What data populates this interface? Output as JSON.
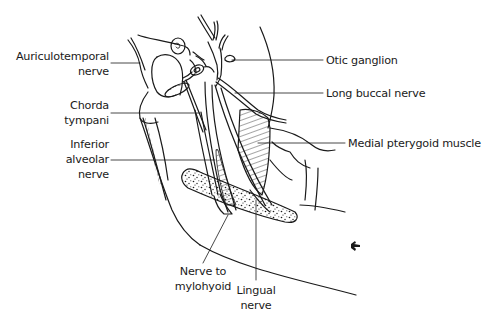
{
  "diagram": {
    "type": "anatomical-line-drawing",
    "colors": {
      "ink": "#1a1a1a",
      "leader": "#333333",
      "background": "#ffffff"
    },
    "labels": {
      "auriculotemporal": {
        "lines": [
          "Auriculotemporal",
          "nerve"
        ]
      },
      "chorda_tympani": {
        "lines": [
          "Chorda",
          "tympani"
        ]
      },
      "inferior_alveolar": {
        "lines": [
          "Inferior",
          "alveolar",
          "nerve"
        ]
      },
      "otic_ganglion": {
        "lines": [
          "Otic ganglion"
        ]
      },
      "long_buccal": {
        "lines": [
          "Long buccal nerve"
        ]
      },
      "medial_pterygoid": {
        "lines": [
          "Medial pterygoid muscle"
        ]
      },
      "nerve_to_mylohyoid": {
        "lines": [
          "Nerve to",
          "mylohyoid"
        ]
      },
      "lingual_nerve": {
        "lines": [
          "Lingual",
          "nerve"
        ]
      }
    }
  }
}
